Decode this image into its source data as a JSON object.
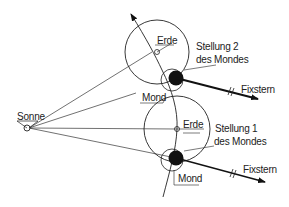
{
  "diagram": {
    "labels": {
      "sun": "Sonne",
      "earth_top": "Erde",
      "earth_bottom": "Erde",
      "moon_top": "Mond",
      "moon_bottom": "Mond",
      "position2_line1": "Stellung 2",
      "position2_line2": "des Mondes",
      "position1_line1": "Stellung 1",
      "position1_line2": "des Mondes",
      "fixed_star_top": "Fixstern",
      "fixed_star_bottom": "Fixstern"
    },
    "colors": {
      "line": "#222222",
      "moon_dark": "#111111",
      "background": "#ffffff"
    }
  }
}
